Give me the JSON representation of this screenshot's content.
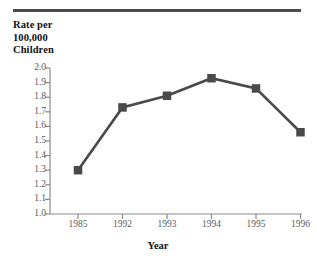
{
  "figure": {
    "rule_color": "#4a4a4a",
    "series_color": "#4a4a4a",
    "axis_color": "#8a8a8a",
    "tick_text_color": "#5a5a5a",
    "label_text_color": "#111111"
  },
  "ylabel_lines": [
    "Rate per",
    "100,000",
    "Children"
  ],
  "chart_data": {
    "type": "line",
    "title": "",
    "xlabel": "Year",
    "ylabel": "Rate per 100,000 Children",
    "categories": [
      "1985",
      "1992",
      "1993",
      "1994",
      "1995",
      "1996"
    ],
    "values": [
      1.3,
      1.73,
      1.81,
      1.93,
      1.86,
      1.56
    ],
    "yticks": [
      "2.0",
      "1.9",
      "1.8",
      "1.7",
      "1.6",
      "1.5",
      "1.4",
      "1.3",
      "1.2",
      "1.1",
      "1.0"
    ],
    "ytick_values": [
      2.0,
      1.9,
      1.8,
      1.7,
      1.6,
      1.5,
      1.4,
      1.3,
      1.2,
      1.1,
      1.0
    ],
    "ylim": [
      1.0,
      2.0
    ],
    "grid": false,
    "legend": "none",
    "marker": "square",
    "series": [
      {
        "name": "Rate per 100,000 Children",
        "values": [
          1.3,
          1.73,
          1.81,
          1.93,
          1.86,
          1.56
        ]
      }
    ]
  }
}
